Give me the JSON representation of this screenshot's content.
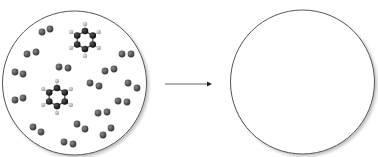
{
  "diagram": {
    "colors": {
      "circle_stroke": "#555555",
      "carbon": "#1a1a1a",
      "hydrogen": "#bdbdbd",
      "diatomic": "#555555",
      "arrow": "#555555"
    },
    "left_circle": {
      "cx": 74.5,
      "cy": 83,
      "r": 72
    },
    "right_circle": {
      "cx": 302.5,
      "cy": 82,
      "r": 72
    },
    "arrow": {
      "x1": 165,
      "y1": 84,
      "x2": 212,
      "y2": 84
    },
    "benzenes": [
      {
        "cx": 85,
        "cy": 40
      },
      {
        "cx": 57,
        "cy": 97
      }
    ],
    "diatomics": [
      [
        [
          42,
          32
        ],
        [
          50,
          29
        ]
      ],
      [
        [
          27,
          54
        ],
        [
          36,
          52
        ]
      ],
      [
        [
          15,
          72
        ],
        [
          23,
          74
        ]
      ],
      [
        [
          15,
          100
        ],
        [
          23,
          98
        ]
      ],
      [
        [
          33,
          127
        ],
        [
          41,
          132
        ]
      ],
      [
        [
          64,
          142
        ],
        [
          73,
          144
        ]
      ],
      [
        [
          59,
          67
        ],
        [
          68,
          68
        ]
      ],
      [
        [
          90,
          83
        ],
        [
          99,
          86
        ]
      ],
      [
        [
          105,
          71
        ],
        [
          114,
          69
        ]
      ],
      [
        [
          122,
          54
        ],
        [
          131,
          54
        ]
      ],
      [
        [
          128,
          83
        ],
        [
          137,
          88
        ]
      ],
      [
        [
          118,
          101
        ],
        [
          127,
          102
        ]
      ],
      [
        [
          98,
          113
        ],
        [
          107,
          112
        ]
      ],
      [
        [
          77,
          124
        ],
        [
          85,
          129
        ]
      ],
      [
        [
          103,
          135
        ],
        [
          111,
          128
        ]
      ]
    ]
  }
}
